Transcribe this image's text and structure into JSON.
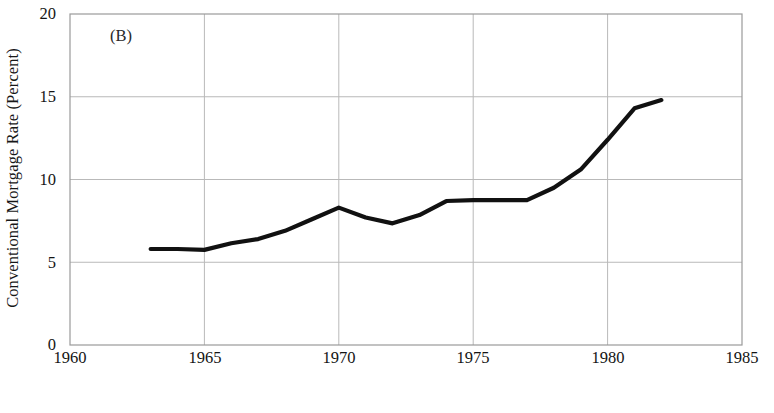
{
  "figure": {
    "panel_label": "(B)",
    "background": "#ffffff",
    "line_color": "#111111",
    "grid_color": "#b9b9b9",
    "axis_color": "#9a9a9a"
  },
  "chart_data": {
    "type": "line",
    "title": "",
    "panel": "(B)",
    "xlabel": "Year",
    "ylabel": "Conventional Mortgage Rate (Percent)",
    "xlim": [
      1960,
      1985
    ],
    "ylim": [
      0,
      20
    ],
    "xticks": [
      1960,
      1965,
      1970,
      1975,
      1980,
      1985
    ],
    "xticklabels": [
      "1960",
      "1965",
      "1970",
      "1975",
      "1980",
      "1985"
    ],
    "yticks": [
      0,
      5,
      10,
      15,
      20
    ],
    "yticklabels": [
      "0",
      "5",
      "10",
      "15",
      "20"
    ],
    "grid": true,
    "legend": "none",
    "series": [
      {
        "name": "Conventional Mortgage Rate",
        "x": [
          1963,
          1964,
          1965,
          1966,
          1967,
          1968,
          1969,
          1970,
          1971,
          1972,
          1973,
          1974,
          1975,
          1976,
          1977,
          1978,
          1979,
          1980,
          1981,
          1982
        ],
        "values": [
          5.8,
          5.8,
          5.75,
          6.15,
          6.4,
          6.9,
          7.6,
          8.3,
          7.7,
          7.35,
          7.85,
          8.7,
          8.75,
          8.75,
          8.75,
          9.5,
          10.6,
          12.4,
          14.3,
          14.8
        ]
      }
    ]
  }
}
